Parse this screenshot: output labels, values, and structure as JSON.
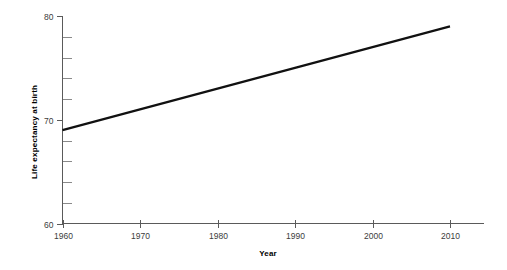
{
  "chart_data": {
    "type": "line",
    "title": "",
    "subtitle": "",
    "xlabel": "Year",
    "ylabel": "Life expectancy at birth",
    "x": [
      1960,
      2010
    ],
    "values": [
      69.0,
      79.0
    ],
    "series": [
      {
        "name": "Life expectancy at birth",
        "x": [
          1960,
          1970,
          1980,
          1990,
          2000,
          2010
        ],
        "values": [
          69.0,
          71.0,
          73.0,
          75.0,
          77.0,
          79.0
        ],
        "color": "#111111"
      }
    ],
    "xlim": [
      1960,
      2010
    ],
    "ylim": [
      60,
      80
    ],
    "x_ticks": [
      1960,
      1970,
      1980,
      1990,
      2000,
      2010
    ],
    "x_tick_labels": [
      "1960",
      "1970",
      "1980",
      "1990",
      "2000",
      "2010"
    ],
    "y_ticks": [
      60,
      70,
      80
    ],
    "y_tick_labels": [
      "60",
      "70",
      "80"
    ],
    "y_minor_ticks": [
      62,
      64,
      66,
      68,
      72,
      74,
      76,
      78
    ],
    "grid": false,
    "legend": false,
    "legend_position": "none",
    "annotations": []
  },
  "axes": {
    "y_axis_title": "Life expectancy at birth",
    "x_axis_title": "Year"
  },
  "colors": {
    "line": "#111111",
    "axis": "#5a5a5a",
    "minor_tick": "#8a8a8a",
    "tick_text": "#3c3c3c",
    "title_text": "#000000",
    "background": "#ffffff"
  }
}
